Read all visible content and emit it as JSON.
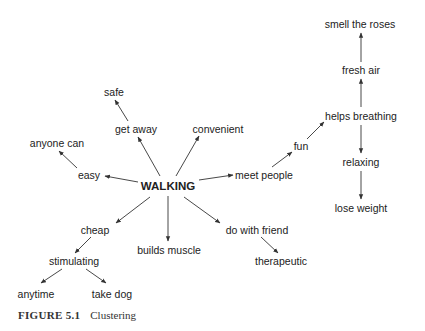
{
  "figure": {
    "label": "FIGURE 5.1",
    "title": "Clustering"
  },
  "diagram": {
    "type": "cluster-map",
    "root": "WALKING",
    "nodes": [
      {
        "id": "walking",
        "text": "WALKING",
        "x": 168,
        "y": 186,
        "root": true
      },
      {
        "id": "easy",
        "text": "easy",
        "x": 89,
        "y": 175
      },
      {
        "id": "anyone_can",
        "text": "anyone can",
        "x": 57,
        "y": 143
      },
      {
        "id": "get_away",
        "text": "get away",
        "x": 136,
        "y": 129
      },
      {
        "id": "safe",
        "text": "safe",
        "x": 114,
        "y": 92
      },
      {
        "id": "convenient",
        "text": "convenient",
        "x": 218,
        "y": 129
      },
      {
        "id": "meet_people",
        "text": "meet people",
        "x": 264,
        "y": 175
      },
      {
        "id": "fun",
        "text": "fun",
        "x": 301,
        "y": 146
      },
      {
        "id": "helps_breathing",
        "text": "helps breathing",
        "x": 361,
        "y": 116
      },
      {
        "id": "fresh_air",
        "text": "fresh air",
        "x": 361,
        "y": 70
      },
      {
        "id": "smell_the_roses",
        "text": "smell the roses",
        "x": 360,
        "y": 24
      },
      {
        "id": "relaxing",
        "text": "relaxing",
        "x": 361,
        "y": 162
      },
      {
        "id": "lose_weight",
        "text": "lose weight",
        "x": 361,
        "y": 208
      },
      {
        "id": "cheap",
        "text": "cheap",
        "x": 95,
        "y": 230
      },
      {
        "id": "stimulating",
        "text": "stimulating",
        "x": 74,
        "y": 261
      },
      {
        "id": "anytime",
        "text": "anytime",
        "x": 36,
        "y": 294
      },
      {
        "id": "take_dog",
        "text": "take dog",
        "x": 112,
        "y": 294
      },
      {
        "id": "builds_muscle",
        "text": "builds muscle",
        "x": 169,
        "y": 250
      },
      {
        "id": "do_with_friend",
        "text": "do with friend",
        "x": 257,
        "y": 230
      },
      {
        "id": "therapeutic",
        "text": "therapeutic",
        "x": 281,
        "y": 261
      }
    ],
    "edges": [
      {
        "from": "walking",
        "to": "easy",
        "x1": 138,
        "y1": 182,
        "x2": 105,
        "y2": 176
      },
      {
        "from": "easy",
        "to": "anyone_can",
        "x1": 77,
        "y1": 168,
        "x2": 59,
        "y2": 151
      },
      {
        "from": "walking",
        "to": "get_away",
        "x1": 160,
        "y1": 176,
        "x2": 138,
        "y2": 137
      },
      {
        "from": "get_away",
        "to": "safe",
        "x1": 128,
        "y1": 121,
        "x2": 115,
        "y2": 100
      },
      {
        "from": "walking",
        "to": "convenient",
        "x1": 176,
        "y1": 176,
        "x2": 199,
        "y2": 136
      },
      {
        "from": "walking",
        "to": "meet_people",
        "x1": 199,
        "y1": 180,
        "x2": 233,
        "y2": 175
      },
      {
        "from": "meet_people",
        "to": "fun",
        "x1": 272,
        "y1": 167,
        "x2": 292,
        "y2": 152
      },
      {
        "from": "fun",
        "to": "helps_breathing",
        "x1": 307,
        "y1": 139,
        "x2": 324,
        "y2": 122
      },
      {
        "from": "helps_breathing",
        "to": "fresh_air",
        "x1": 361,
        "y1": 107,
        "x2": 361,
        "y2": 79
      },
      {
        "from": "fresh_air",
        "to": "smell_the_roses",
        "x1": 361,
        "y1": 62,
        "x2": 361,
        "y2": 33
      },
      {
        "from": "helps_breathing",
        "to": "relaxing",
        "x1": 361,
        "y1": 125,
        "x2": 361,
        "y2": 153
      },
      {
        "from": "relaxing",
        "to": "lose_weight",
        "x1": 361,
        "y1": 171,
        "x2": 361,
        "y2": 199
      },
      {
        "from": "walking",
        "to": "cheap",
        "x1": 150,
        "y1": 197,
        "x2": 116,
        "y2": 223
      },
      {
        "from": "cheap",
        "to": "stimulating",
        "x1": 91,
        "y1": 237,
        "x2": 75,
        "y2": 253
      },
      {
        "from": "stimulating",
        "to": "anytime",
        "x1": 62,
        "y1": 269,
        "x2": 41,
        "y2": 283
      },
      {
        "from": "stimulating",
        "to": "take_dog",
        "x1": 86,
        "y1": 269,
        "x2": 106,
        "y2": 283
      },
      {
        "from": "walking",
        "to": "builds_muscle",
        "x1": 168,
        "y1": 196,
        "x2": 168,
        "y2": 241
      },
      {
        "from": "walking",
        "to": "do_with_friend",
        "x1": 184,
        "y1": 197,
        "x2": 220,
        "y2": 223
      },
      {
        "from": "do_with_friend",
        "to": "therapeutic",
        "x1": 261,
        "y1": 237,
        "x2": 278,
        "y2": 253
      }
    ],
    "colors": {
      "text": "#222222",
      "edge": "#333333",
      "background": "#ffffff"
    }
  }
}
